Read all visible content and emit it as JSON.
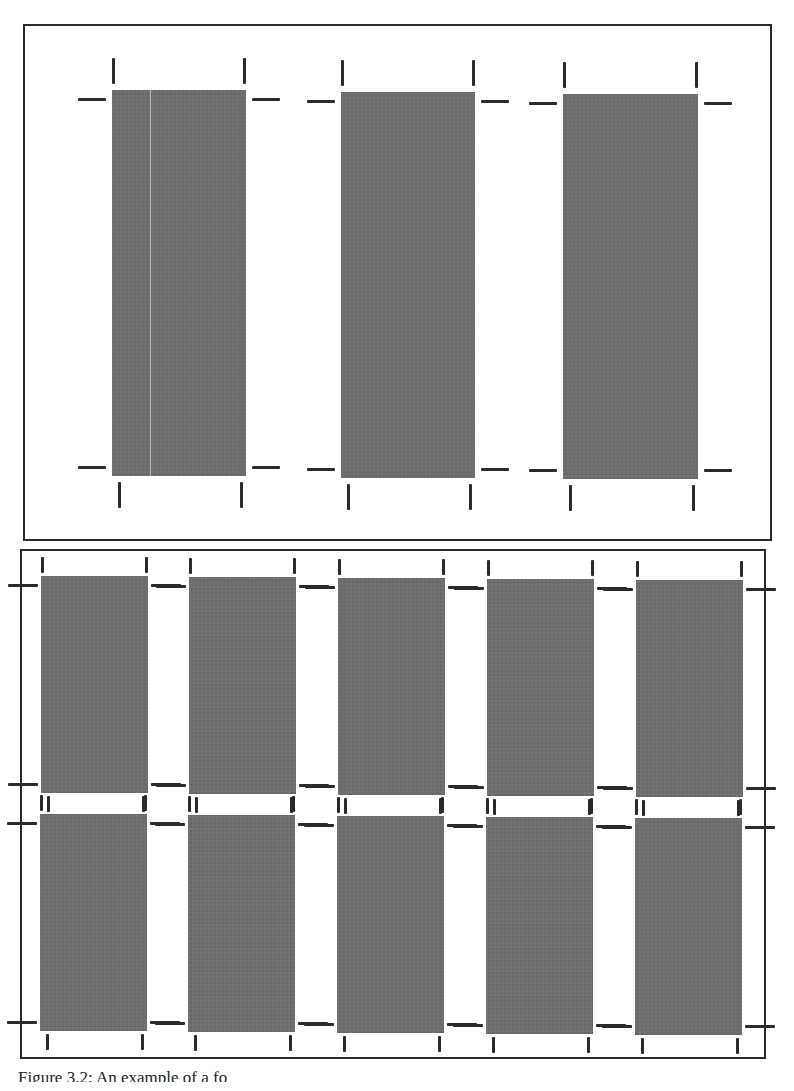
{
  "figure": {
    "caption": "Figure 3.2: An example of a fo",
    "colors": {
      "card_fill": "#6f6f6f",
      "crop_mark": "#2a2a2a",
      "panel_border": "#2a2a2a",
      "background": "#ffffff"
    }
  },
  "top_panel": {
    "label": "3-up imposition layout with crop marks",
    "layout": {
      "columns": 3,
      "rows": 1
    },
    "cards": [
      {
        "x": 112,
        "y": 90,
        "w": 134,
        "h": 386,
        "fold_x": 38
      },
      {
        "x": 341,
        "y": 92,
        "w": 134,
        "h": 386
      },
      {
        "x": 563,
        "y": 94,
        "w": 135,
        "h": 385
      }
    ]
  },
  "bottom_panel": {
    "label": "10-up imposition layout with crop marks",
    "layout": {
      "columns": 5,
      "rows": 2
    },
    "cards": [
      {
        "x": 41,
        "y": 576,
        "w": 107,
        "h": 217
      },
      {
        "x": 189,
        "y": 577,
        "w": 107,
        "h": 217
      },
      {
        "x": 338,
        "y": 578,
        "w": 107,
        "h": 217
      },
      {
        "x": 487,
        "y": 579,
        "w": 107,
        "h": 217
      },
      {
        "x": 636,
        "y": 580,
        "w": 107,
        "h": 217
      },
      {
        "x": 40,
        "y": 814,
        "w": 107,
        "h": 217
      },
      {
        "x": 188,
        "y": 815,
        "w": 107,
        "h": 217
      },
      {
        "x": 337,
        "y": 816,
        "w": 107,
        "h": 217
      },
      {
        "x": 486,
        "y": 817,
        "w": 107,
        "h": 217
      },
      {
        "x": 635,
        "y": 818,
        "w": 107,
        "h": 217
      }
    ]
  }
}
